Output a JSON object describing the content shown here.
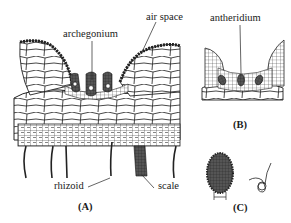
{
  "figure": {
    "panels": [
      {
        "id": "A",
        "label": "(A)",
        "content": "cross-section of thallus with archegonia, air spaces, rhizoids and scale"
      },
      {
        "id": "B",
        "label": "(B)",
        "content": "cross-section with antheridia"
      },
      {
        "id": "C",
        "label": "(C)",
        "content": "antheridium and sperm cell"
      }
    ],
    "labels": {
      "archegonium": "archegonium",
      "air_space": "air space",
      "antheridium": "antheridium",
      "rhizoid": "rhizoid",
      "scale": "scale"
    },
    "colors": {
      "ink": "#1a1a1a",
      "background": "#ffffff"
    }
  }
}
